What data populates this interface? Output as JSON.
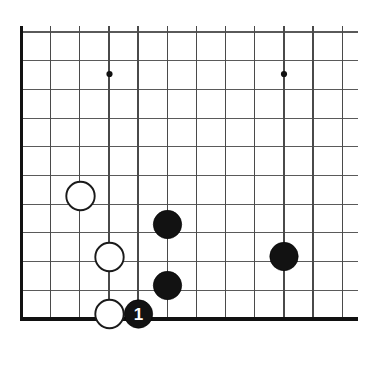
{
  "figure": {
    "board_style": "go-goban",
    "orientation": "bottom-left-corner",
    "background_color": "#ffffff",
    "line_color": "#5a5a5a",
    "edge_color": "#111111",
    "black_stone_color": "#121212",
    "white_stone_color": "#ffffff",
    "white_stone_outline": "#1a1a1a"
  },
  "board": {
    "visible_columns": 12,
    "visible_rows": 11,
    "origin_x": 21.5,
    "origin_y": 32.0,
    "col_spacing": 29.15,
    "row_spacing": 28.7,
    "stone_radius": 14.2,
    "left_edge_is_board_edge": true,
    "bottom_edge_is_board_edge": true,
    "top_edge_is_board_edge": false,
    "right_edge_is_board_edge": false
  },
  "star_points": [
    {
      "name": "star-point-left",
      "col": 3,
      "row": 1,
      "x": 109.5,
      "y": 74.0
    },
    {
      "name": "star-point-right",
      "col": 9,
      "row": 1,
      "x": 284.0,
      "y": 74.0
    }
  ],
  "stones": [
    {
      "id": "w1",
      "color": "white",
      "label": "",
      "col": 2,
      "row": 5,
      "x": 80.5,
      "y": 196.0
    },
    {
      "id": "b1",
      "color": "black",
      "label": "",
      "col": 5,
      "row": 6,
      "x": 167.5,
      "y": 224.5
    },
    {
      "id": "w2",
      "color": "white",
      "label": "",
      "col": 3,
      "row": 7,
      "x": 109.5,
      "y": 257.0
    },
    {
      "id": "b2",
      "color": "black",
      "label": "",
      "col": 9,
      "row": 7,
      "x": 284.0,
      "y": 256.5
    },
    {
      "id": "b3",
      "color": "black",
      "label": "",
      "col": 5,
      "row": 8,
      "x": 167.5,
      "y": 285.5
    },
    {
      "id": "w3",
      "color": "white",
      "label": "",
      "col": 3,
      "row": 9,
      "x": 109.5,
      "y": 314.0
    },
    {
      "id": "b4",
      "color": "black",
      "label": "1",
      "col": 4,
      "row": 9,
      "x": 138.5,
      "y": 314.0
    }
  ],
  "move_markers": [
    {
      "number": "1",
      "stone_id": "b4",
      "text_color": "#ffffff"
    }
  ]
}
